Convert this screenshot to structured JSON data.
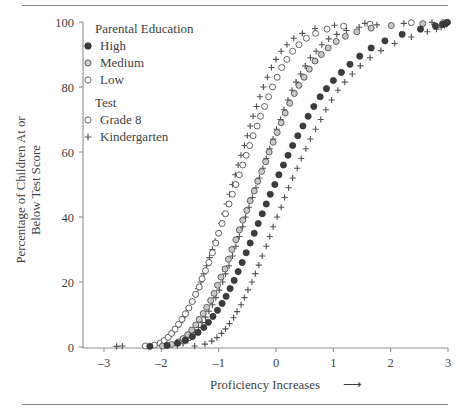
{
  "figure": {
    "top_rule": "",
    "bottom_rule": ""
  },
  "legend": {
    "group1_title": "Parental Education",
    "group1_items": [
      {
        "label": "High",
        "marker": "filled-circle-icon"
      },
      {
        "label": "Medium",
        "marker": "gray-circle-icon"
      },
      {
        "label": "Low",
        "marker": "open-circle-icon"
      }
    ],
    "group2_title": "Test",
    "group2_items": [
      {
        "label": "Grade 8",
        "marker": "open-circle-icon"
      },
      {
        "label": "Kindergarten",
        "marker": "plus-icon"
      }
    ]
  },
  "chart_data": {
    "type": "scatter",
    "title": "",
    "xlabel": "Proficiency Increases",
    "xlabel_suffix": "⟶",
    "ylabel_line1": "Percentage of Children At or",
    "ylabel_line2": "Below Test Score",
    "xlim": [
      -3.35,
      3.15
    ],
    "ylim": [
      -2,
      101
    ],
    "xticks": [
      -3,
      -2,
      -1,
      0,
      1,
      2,
      3
    ],
    "xticklabels": [
      "–3",
      "–2",
      "–1",
      "0",
      "1",
      "2",
      "3"
    ],
    "yticks": [
      0,
      20,
      40,
      60,
      80,
      100
    ],
    "yticklabels": [
      "0",
      "20",
      "40",
      "60",
      "80",
      "100"
    ],
    "grid": false,
    "legend_position": "upper-left-inside",
    "n_points_per_series": 46,
    "series": [
      {
        "name": "Low – Kindergarten",
        "education": "Low",
        "test": "Kindergarten",
        "marker": "plus",
        "mean": -0.82,
        "scale": 0.62,
        "x": [
          -2.78,
          -2.68,
          -1.95,
          -1.88,
          -1.82,
          -1.77,
          -1.72,
          -1.67,
          -1.62,
          -1.57,
          -1.52,
          -1.46,
          -1.41,
          -1.36,
          -1.31,
          -1.26,
          -1.21,
          -1.16,
          -1.11,
          -1.06,
          -1.01,
          -0.96,
          -0.91,
          -0.86,
          -0.81,
          -0.76,
          -0.71,
          -0.66,
          -0.61,
          -0.55,
          -0.5,
          -0.45,
          -0.4,
          -0.34,
          -0.28,
          -0.22,
          -0.15,
          -0.08,
          0.0,
          0.09,
          0.19,
          0.31,
          0.46,
          0.68,
          1.02,
          1.55
        ],
        "y": [
          0.2,
          0.3,
          2.0,
          3.0,
          4.0,
          5.0,
          6.2,
          7.5,
          9.0,
          10.5,
          12.0,
          14.0,
          16.0,
          18.0,
          20.0,
          22.5,
          25.0,
          27.5,
          30.0,
          32.5,
          35.0,
          38.0,
          41.0,
          44.0,
          47.0,
          50.0,
          53.0,
          56.0,
          59.0,
          62.0,
          65.0,
          68.0,
          71.0,
          74.0,
          77.0,
          80.0,
          83.0,
          86.0,
          88.5,
          91.0,
          93.0,
          95.0,
          96.5,
          98.0,
          99.0,
          99.6
        ]
      },
      {
        "name": "Low – Grade 8",
        "education": "Low",
        "test": "Grade 8",
        "marker": "open-circle",
        "mean": -0.78,
        "scale": 0.66,
        "x": [
          -2.28,
          -2.12,
          -2.02,
          -1.95,
          -1.88,
          -1.82,
          -1.76,
          -1.7,
          -1.64,
          -1.58,
          -1.52,
          -1.46,
          -1.4,
          -1.34,
          -1.29,
          -1.23,
          -1.17,
          -1.11,
          -1.05,
          -1.0,
          -0.94,
          -0.88,
          -0.82,
          -0.76,
          -0.7,
          -0.64,
          -0.58,
          -0.52,
          -0.46,
          -0.4,
          -0.33,
          -0.27,
          -0.2,
          -0.13,
          -0.06,
          0.02,
          0.1,
          0.19,
          0.29,
          0.4,
          0.53,
          0.69,
          0.89,
          1.18,
          1.64,
          2.36
        ],
        "y": [
          0.3,
          0.6,
          1.2,
          2.0,
          3.0,
          4.2,
          5.5,
          7.0,
          8.5,
          10.2,
          12.0,
          14.0,
          16.2,
          18.5,
          21.0,
          23.5,
          26.0,
          29.0,
          32.0,
          35.0,
          38.0,
          41.0,
          44.0,
          47.0,
          50.0,
          53.0,
          56.0,
          59.0,
          62.0,
          65.0,
          68.0,
          71.0,
          74.0,
          77.0,
          80.0,
          83.0,
          86.0,
          88.5,
          91.0,
          93.0,
          95.0,
          96.5,
          97.8,
          98.7,
          99.3,
          99.8
        ]
      },
      {
        "name": "Medium – Kindergarten",
        "education": "Medium",
        "test": "Kindergarten",
        "marker": "plus",
        "mean": -0.32,
        "scale": 0.66,
        "x": [
          -1.72,
          -1.62,
          -1.54,
          -1.47,
          -1.41,
          -1.35,
          -1.29,
          -1.23,
          -1.17,
          -1.11,
          -1.05,
          -0.99,
          -0.93,
          -0.88,
          -0.82,
          -0.76,
          -0.7,
          -0.64,
          -0.58,
          -0.53,
          -0.47,
          -0.41,
          -0.35,
          -0.29,
          -0.23,
          -0.17,
          -0.11,
          -0.05,
          0.01,
          0.08,
          0.14,
          0.21,
          0.28,
          0.35,
          0.43,
          0.51,
          0.6,
          0.7,
          0.8,
          0.92,
          1.06,
          1.23,
          1.45,
          1.76,
          2.23,
          2.72
        ],
        "y": [
          0.4,
          1.0,
          2.0,
          3.2,
          4.5,
          6.0,
          7.5,
          9.2,
          11.0,
          13.0,
          15.2,
          17.5,
          20.0,
          22.5,
          25.0,
          28.0,
          31.0,
          34.0,
          37.0,
          40.0,
          43.0,
          46.0,
          49.0,
          52.0,
          55.0,
          58.0,
          61.0,
          64.0,
          67.0,
          70.0,
          73.0,
          76.0,
          79.0,
          81.5,
          84.0,
          86.5,
          89.0,
          91.0,
          93.0,
          94.8,
          96.2,
          97.4,
          98.4,
          99.1,
          99.6,
          99.9
        ]
      },
      {
        "name": "Medium – Grade 8",
        "education": "Medium",
        "test": "Grade 8",
        "marker": "gray-circle",
        "mean": -0.28,
        "scale": 0.7,
        "x": [
          -1.98,
          -1.82,
          -1.7,
          -1.62,
          -1.54,
          -1.47,
          -1.4,
          -1.34,
          -1.27,
          -1.21,
          -1.14,
          -1.08,
          -1.02,
          -0.96,
          -0.89,
          -0.83,
          -0.77,
          -0.7,
          -0.64,
          -0.58,
          -0.51,
          -0.45,
          -0.38,
          -0.32,
          -0.25,
          -0.18,
          -0.12,
          -0.05,
          0.02,
          0.09,
          0.16,
          0.24,
          0.32,
          0.4,
          0.49,
          0.58,
          0.68,
          0.79,
          0.91,
          1.05,
          1.21,
          1.41,
          1.66,
          2.01,
          2.56,
          2.92
        ],
        "y": [
          0.3,
          0.8,
          1.6,
          2.6,
          3.8,
          5.2,
          6.8,
          8.5,
          10.3,
          12.2,
          14.3,
          16.5,
          19.0,
          21.5,
          24.0,
          27.0,
          30.0,
          33.0,
          36.0,
          39.0,
          42.0,
          45.0,
          48.0,
          51.0,
          54.0,
          57.0,
          60.0,
          63.0,
          66.0,
          69.0,
          72.0,
          75.0,
          78.0,
          80.5,
          83.0,
          85.5,
          88.0,
          90.0,
          92.0,
          94.0,
          95.6,
          97.0,
          98.1,
          98.9,
          99.5,
          99.8
        ]
      },
      {
        "name": "High – Kindergarten",
        "education": "High",
        "test": "Kindergarten",
        "marker": "plus",
        "mean": 0.33,
        "scale": 0.7,
        "x": [
          -1.42,
          -1.24,
          -1.12,
          -1.03,
          -0.95,
          -0.88,
          -0.81,
          -0.74,
          -0.68,
          -0.61,
          -0.55,
          -0.49,
          -0.42,
          -0.36,
          -0.3,
          -0.24,
          -0.17,
          -0.11,
          -0.05,
          0.02,
          0.09,
          0.15,
          0.22,
          0.29,
          0.37,
          0.44,
          0.52,
          0.6,
          0.69,
          0.78,
          0.87,
          0.97,
          1.08,
          1.2,
          1.33,
          1.47,
          1.64,
          1.83,
          2.07,
          2.36,
          2.64,
          2.8,
          2.88,
          2.94,
          2.97,
          2.99
        ],
        "y": [
          0.3,
          0.9,
          1.8,
          2.9,
          4.2,
          5.6,
          7.2,
          9.0,
          10.9,
          13.0,
          15.2,
          17.6,
          20.0,
          22.6,
          25.2,
          28.0,
          31.0,
          34.0,
          37.0,
          40.0,
          43.0,
          46.0,
          49.0,
          52.0,
          55.0,
          58.0,
          61.0,
          64.0,
          67.0,
          70.0,
          73.0,
          76.0,
          79.0,
          81.5,
          84.0,
          86.5,
          89.0,
          91.2,
          93.4,
          95.4,
          97.0,
          97.8,
          98.4,
          98.9,
          99.3,
          99.6
        ]
      },
      {
        "name": "High – Grade 8",
        "education": "High",
        "test": "Grade 8",
        "marker": "filled-circle",
        "mean": 0.4,
        "scale": 0.74,
        "x": [
          -2.2,
          -1.9,
          -1.72,
          -1.58,
          -1.46,
          -1.36,
          -1.26,
          -1.18,
          -1.1,
          -1.02,
          -0.94,
          -0.87,
          -0.8,
          -0.73,
          -0.66,
          -0.59,
          -0.52,
          -0.45,
          -0.38,
          -0.31,
          -0.24,
          -0.17,
          -0.1,
          -0.02,
          0.05,
          0.13,
          0.21,
          0.29,
          0.38,
          0.47,
          0.56,
          0.66,
          0.77,
          0.88,
          1.0,
          1.14,
          1.29,
          1.46,
          1.66,
          1.9,
          2.2,
          2.52,
          2.78,
          2.9,
          2.96,
          2.99
        ],
        "y": [
          0.2,
          0.5,
          1.2,
          2.1,
          3.2,
          4.5,
          6.0,
          7.6,
          9.4,
          11.3,
          13.4,
          15.6,
          18.0,
          20.5,
          23.2,
          26.0,
          29.0,
          32.0,
          35.0,
          38.0,
          41.0,
          44.0,
          47.0,
          50.0,
          53.0,
          56.0,
          59.0,
          62.0,
          65.0,
          68.0,
          71.0,
          74.0,
          77.0,
          79.5,
          82.0,
          84.5,
          87.0,
          89.5,
          92.0,
          94.2,
          96.2,
          97.8,
          98.8,
          99.2,
          99.6,
          99.9
        ]
      }
    ]
  }
}
